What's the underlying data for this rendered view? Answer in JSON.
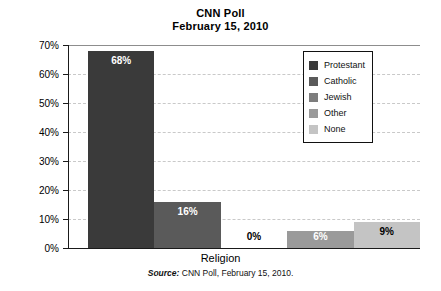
{
  "chart_data": {
    "type": "bar",
    "title": "CNN Poll",
    "subtitle": "February 15, 2010",
    "xlabel": "Religion",
    "ylabel": "",
    "ylim": [
      0,
      70
    ],
    "ytick_step": 10,
    "grid": true,
    "legend_position": "top-right",
    "categories": [
      "Protestant",
      "Catholic",
      "Jewish",
      "Other",
      "None"
    ],
    "values": [
      68,
      16,
      0,
      6,
      9
    ],
    "value_labels": [
      "68%",
      "16%",
      "0%",
      "6%",
      "9%"
    ],
    "ytick_labels": [
      "0%",
      "10%",
      "20%",
      "30%",
      "40%",
      "50%",
      "60%",
      "70%"
    ],
    "ytick_values": [
      0,
      10,
      20,
      30,
      40,
      50,
      60,
      70
    ],
    "series": [
      {
        "name": "Religion share",
        "values": [
          68,
          16,
          0,
          6,
          9
        ]
      }
    ],
    "bar_colors": [
      "#3a3a3a",
      "#5a5a5a",
      "#7d7d7d",
      "#9a9a9a",
      "#c4c4c4"
    ],
    "label_colors": [
      "#ffffff",
      "#ffffff",
      "#000000",
      "#ffffff",
      "#000000"
    ],
    "annotations": []
  },
  "legend": {
    "items": [
      {
        "label": "Protestant",
        "color": "#3a3a3a"
      },
      {
        "label": "Catholic",
        "color": "#5a5a5a"
      },
      {
        "label": "Jewish",
        "color": "#7d7d7d"
      },
      {
        "label": "Other",
        "color": "#9a9a9a"
      },
      {
        "label": "None",
        "color": "#c4c4c4"
      }
    ]
  },
  "source": {
    "prefix": "Source:",
    "text": "CNN Poll, February 15, 2010."
  }
}
